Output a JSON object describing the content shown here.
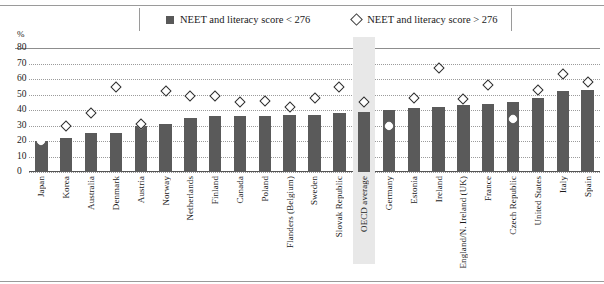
{
  "axis_unit": "%",
  "legend": {
    "items": [
      {
        "label": "NEET and literacy score < 276",
        "marker": "filled-square",
        "color": "#5a5a5a"
      },
      {
        "label": "NEET and literacy score > 276",
        "marker": "open-diamond",
        "color": "#ffffff"
      }
    ]
  },
  "chart_data": {
    "type": "bar",
    "title": "",
    "xlabel": "",
    "ylabel": "%",
    "ylim": [
      0,
      80
    ],
    "yticks": [
      0,
      10,
      20,
      30,
      40,
      50,
      60,
      70,
      80
    ],
    "grid": true,
    "legend_position": "top-center",
    "highlight_category": "OECD average",
    "categories": [
      "Japan",
      "Korea",
      "Australia",
      "Denmark",
      "Austria",
      "Norway",
      "Netherlands",
      "Finland",
      "Canada",
      "Poland",
      "Flanders (Belgium)",
      "Sweden",
      "Slovak Republic",
      "OECD average",
      "Germany",
      "Estonia",
      "Ireland",
      "England/N. Ireland (UK)",
      "France",
      "Czech Republic",
      "United States",
      "Italy",
      "Spain"
    ],
    "series": [
      {
        "name": "NEET and literacy score < 276",
        "marker": "bar",
        "values": [
          20,
          22,
          25,
          25,
          30,
          31,
          35,
          36,
          36,
          36,
          37,
          37,
          38,
          39,
          40,
          41,
          42,
          43,
          44,
          45,
          48,
          52,
          53
        ]
      },
      {
        "name": "NEET and literacy score > 276",
        "marker": "diamond",
        "values": [
          20,
          30,
          38,
          55,
          31,
          52,
          49,
          49,
          45,
          46,
          42,
          48,
          55,
          45,
          30,
          48,
          67,
          47,
          56,
          34,
          53,
          63,
          58
        ]
      }
    ]
  }
}
